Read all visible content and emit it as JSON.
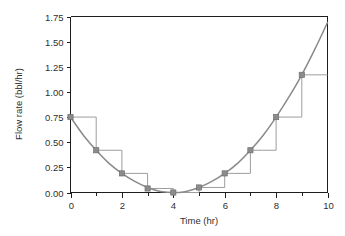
{
  "chart_data": {
    "type": "line",
    "title": "",
    "xlabel": "Time (hr)",
    "ylabel": "Flow rate (bbl/hr)",
    "xlim": [
      0,
      10
    ],
    "ylim": [
      0,
      1.75
    ],
    "grid": false,
    "legend": "none",
    "x_ticks": [
      "0",
      "2",
      "4",
      "6",
      "8",
      "10"
    ],
    "x_tick_values": [
      0,
      2,
      4,
      6,
      8,
      10
    ],
    "x_minor_tick_values": [
      1,
      3,
      5,
      7,
      9
    ],
    "y_ticks": [
      "0.00",
      "0.25",
      "0.50",
      "0.75",
      "1.00",
      "1.25",
      "1.50",
      "1.75"
    ],
    "y_tick_values": [
      0.0,
      0.25,
      0.5,
      0.75,
      1.0,
      1.25,
      1.5,
      1.75
    ],
    "series": [
      {
        "name": "flow-rate-curve",
        "type": "line",
        "style": "smooth-curve",
        "color": "#8a8a8a",
        "x": [
          0.0,
          0.5,
          1.0,
          1.5,
          2.0,
          2.5,
          3.0,
          3.5,
          4.0,
          4.2,
          4.5,
          5.0,
          5.5,
          6.0,
          6.5,
          7.0,
          7.5,
          8.0,
          8.5,
          9.0,
          9.5,
          10.0
        ],
        "y": [
          0.75,
          0.57,
          0.42,
          0.29,
          0.19,
          0.11,
          0.05,
          0.01,
          0.0,
          0.0,
          0.01,
          0.05,
          0.11,
          0.19,
          0.29,
          0.42,
          0.57,
          0.75,
          0.95,
          1.17,
          1.42,
          1.69
        ]
      },
      {
        "name": "sample-points",
        "type": "scatter",
        "marker": "square",
        "color": "#8c8c8c",
        "x": [
          0,
          1,
          2,
          3,
          4,
          5,
          6,
          7,
          8,
          9
        ],
        "y": [
          0.75,
          0.42,
          0.19,
          0.04,
          0.0,
          0.05,
          0.19,
          0.42,
          0.75,
          1.17
        ]
      },
      {
        "name": "step-hold-approximation",
        "type": "step",
        "step_mode": "post",
        "color": "#9d9d9d",
        "x": [
          0,
          1,
          2,
          3,
          4,
          5,
          6,
          7,
          8,
          9,
          10
        ],
        "y": [
          0.75,
          0.42,
          0.19,
          0.04,
          0.0,
          0.05,
          0.19,
          0.42,
          0.75,
          1.17,
          1.17
        ]
      }
    ]
  }
}
